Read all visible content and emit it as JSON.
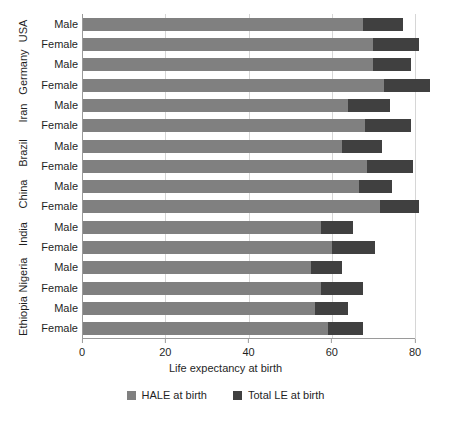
{
  "chart_data": {
    "type": "bar",
    "orientation": "horizontal",
    "stacked": true,
    "title": "",
    "xlabel": "Life expectancy at birth",
    "ylabel": "",
    "xlim": [
      0,
      80
    ],
    "xticks": [
      0,
      20,
      40,
      60,
      80
    ],
    "grid": true,
    "legend_position": "bottom",
    "legend": [
      "HALE at birth",
      "Total LE at birth"
    ],
    "colors": {
      "hale": "#808080",
      "total": "#404040",
      "grid": "#d6d6d6",
      "axis": "#9a9a9a",
      "background": "#ffffff"
    },
    "groups": [
      "USA",
      "Germany",
      "Iran",
      "Brazil",
      "China",
      "India",
      "Nigeria",
      "Ethiopia"
    ],
    "subcategories": [
      "Male",
      "Female"
    ],
    "series": [
      {
        "name": "HALE at birth",
        "key": "hale"
      },
      {
        "name": "Total LE at birth",
        "key": "total"
      }
    ],
    "rows": [
      {
        "country": "USA",
        "sex": "Male",
        "hale": 67.5,
        "total": 77.0
      },
      {
        "country": "USA",
        "sex": "Female",
        "hale": 70.0,
        "total": 81.0
      },
      {
        "country": "Germany",
        "sex": "Male",
        "hale": 70.0,
        "total": 79.0
      },
      {
        "country": "Germany",
        "sex": "Female",
        "hale": 72.5,
        "total": 83.5
      },
      {
        "country": "Iran",
        "sex": "Male",
        "hale": 64.0,
        "total": 74.0
      },
      {
        "country": "Iran",
        "sex": "Female",
        "hale": 68.0,
        "total": 79.0
      },
      {
        "country": "Brazil",
        "sex": "Male",
        "hale": 62.5,
        "total": 72.0
      },
      {
        "country": "Brazil",
        "sex": "Female",
        "hale": 68.5,
        "total": 79.5
      },
      {
        "country": "China",
        "sex": "Male",
        "hale": 66.5,
        "total": 74.5
      },
      {
        "country": "China",
        "sex": "Female",
        "hale": 71.5,
        "total": 81.0
      },
      {
        "country": "India",
        "sex": "Male",
        "hale": 57.5,
        "total": 65.0
      },
      {
        "country": "India",
        "sex": "Female",
        "hale": 60.0,
        "total": 70.5
      },
      {
        "country": "Nigeria",
        "sex": "Male",
        "hale": 55.0,
        "total": 62.5
      },
      {
        "country": "Nigeria",
        "sex": "Female",
        "hale": 57.5,
        "total": 67.5
      },
      {
        "country": "Ethiopia",
        "sex": "Male",
        "hale": 56.0,
        "total": 64.0
      },
      {
        "country": "Ethiopia",
        "sex": "Female",
        "hale": 59.0,
        "total": 67.5
      }
    ]
  }
}
